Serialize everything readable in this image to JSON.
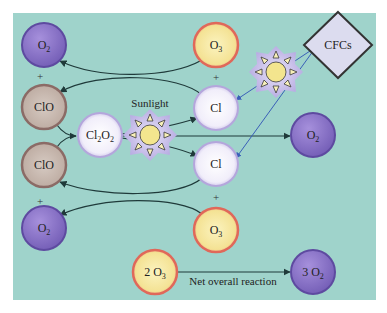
{
  "diagram": {
    "colors": {
      "background": "#9fd3cb",
      "o2_fill": "#8a72c8",
      "o3_fill": "#f6e9a0",
      "o3_ring": "#e0685a",
      "clo_fill": "#c7b8ae",
      "clo_ring": "#8b6b66",
      "cl_fill": "#f3f0fa",
      "cl_ring": "#b4a6dc",
      "arrow_dark": "#1f3a3a",
      "arrow_blue": "#3a5fb8"
    },
    "molecules": {
      "o2_top_left": "O2",
      "clo_upper": "ClO",
      "clo_lower": "ClO",
      "o2_bottom_left": "O2",
      "cl2o2": "Cl2O2",
      "o3_top": "O3",
      "cl_upper": "Cl",
      "cl_lower": "Cl",
      "o3_bottom": "O3",
      "o2_right": "O2",
      "reactant_net": "2 O3",
      "product_net": "3 O2"
    },
    "plus_sign": "+",
    "sunlight_label": "Sunlight",
    "cfcs_label": "CFCs",
    "net_reaction_label": "Net overall reaction"
  }
}
